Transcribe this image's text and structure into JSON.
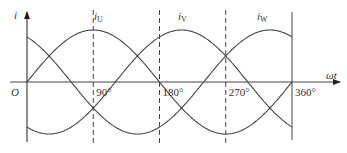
{
  "chart_data": {
    "type": "line",
    "title": "",
    "xlabel": "ωt",
    "ylabel": "i",
    "origin_label": "O",
    "x_unit": "degrees",
    "xlim": [
      0,
      360
    ],
    "ylim": [
      -1,
      1
    ],
    "grid": false,
    "x_ticks": [
      {
        "value": 90,
        "label": "90°"
      },
      {
        "value": 180,
        "label": "180°"
      },
      {
        "value": 270,
        "label": "270°"
      },
      {
        "value": 360,
        "label": "360°"
      }
    ],
    "series": [
      {
        "name": "iU",
        "label_main": "i",
        "label_sub": "U",
        "phase_deg": 0,
        "amplitude": 1,
        "peak_at": 90
      },
      {
        "name": "iV",
        "label_main": "i",
        "label_sub": "V",
        "phase_deg": -120,
        "amplitude": 1,
        "peak_at": 210
      },
      {
        "name": "iW",
        "label_main": "i",
        "label_sub": "W",
        "phase_deg": -240,
        "amplitude": 1,
        "peak_at": 330
      }
    ],
    "dashed_guides": [
      90,
      180,
      270
    ],
    "solid_guide": 360,
    "line_color": "#444444"
  }
}
